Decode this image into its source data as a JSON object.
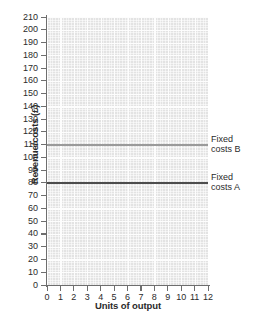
{
  "chart_data": {
    "type": "line",
    "title": "",
    "xlabel": "Units of output",
    "ylabel": "Revenue/costs (£)",
    "xlim": [
      0,
      12
    ],
    "ylim": [
      0,
      210
    ],
    "grid": true,
    "legend_position": "right-inline",
    "x_ticks": [
      "0",
      "1",
      "2",
      "3",
      "4",
      "5",
      "6",
      "7",
      "8",
      "9",
      "10",
      "11",
      "12"
    ],
    "y_ticks": [
      "0",
      "10",
      "20",
      "30",
      "40",
      "50",
      "60",
      "70",
      "80",
      "90",
      "100",
      "110",
      "120",
      "130",
      "140",
      "150",
      "160",
      "170",
      "180",
      "190",
      "200",
      "210"
    ],
    "x": [
      0,
      12
    ],
    "series": [
      {
        "name": "Fixed costs B",
        "label_line_1": "Fixed",
        "label_line_2": "costs B",
        "values": [
          110,
          110
        ],
        "constant_value": 110,
        "color": "#9a9a9a"
      },
      {
        "name": "Fixed costs A",
        "label_line_1": "Fixed",
        "label_line_2": "costs A",
        "values": [
          80,
          80
        ],
        "constant_value": 80,
        "color": "#4d4d4d"
      }
    ],
    "colors": {
      "plot_background": "#e3e3e3",
      "gridline": "#ffffff",
      "axis": "#6e6e6e",
      "text": "#2b2b2b",
      "page_background": "#ffffff"
    }
  }
}
